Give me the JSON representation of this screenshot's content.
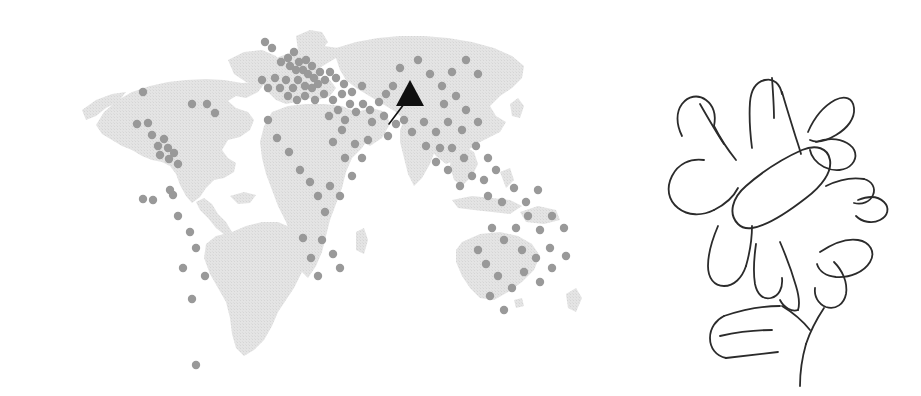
{
  "figure": {
    "kind": "world-map-with-handwritten-annotation",
    "background_color": "#ffffff"
  },
  "map": {
    "name": "world-dot-distribution-map",
    "projection": "equirectangular",
    "land_color": "#e3e3e3",
    "land_texture": "stippled",
    "point_color": "#999999",
    "point_radius_px": 4.2,
    "highlight_marker": {
      "name": "arrow-pointer-marker",
      "shape": "solid-triangle-with-tail",
      "color": "#111111",
      "triangle_apex": [
        410,
        80
      ],
      "triangle_left": [
        396,
        106
      ],
      "triangle_right": [
        424,
        106
      ],
      "tail_start": [
        404,
        104
      ],
      "tail_end": [
        389,
        124
      ],
      "target_label": "South Asia"
    },
    "points": [
      [
        148,
        123
      ],
      [
        152,
        135
      ],
      [
        164,
        139
      ],
      [
        158,
        146
      ],
      [
        168,
        148
      ],
      [
        174,
        153
      ],
      [
        169,
        159
      ],
      [
        178,
        164
      ],
      [
        160,
        155
      ],
      [
        143,
        92
      ],
      [
        137,
        124
      ],
      [
        192,
        104
      ],
      [
        207,
        104
      ],
      [
        215,
        113
      ],
      [
        153,
        200
      ],
      [
        170,
        190
      ],
      [
        178,
        216
      ],
      [
        190,
        232
      ],
      [
        196,
        248
      ],
      [
        183,
        268
      ],
      [
        205,
        276
      ],
      [
        192,
        299
      ],
      [
        173,
        195
      ],
      [
        196,
        365
      ],
      [
        143,
        199
      ],
      [
        265,
        42
      ],
      [
        272,
        48
      ],
      [
        281,
        62
      ],
      [
        288,
        58
      ],
      [
        294,
        52
      ],
      [
        299,
        62
      ],
      [
        303,
        70
      ],
      [
        296,
        70
      ],
      [
        290,
        66
      ],
      [
        306,
        60
      ],
      [
        312,
        66
      ],
      [
        308,
        74
      ],
      [
        314,
        78
      ],
      [
        320,
        72
      ],
      [
        318,
        84
      ],
      [
        325,
        80
      ],
      [
        330,
        72
      ],
      [
        336,
        78
      ],
      [
        312,
        88
      ],
      [
        305,
        86
      ],
      [
        298,
        80
      ],
      [
        293,
        88
      ],
      [
        286,
        80
      ],
      [
        280,
        88
      ],
      [
        275,
        78
      ],
      [
        268,
        88
      ],
      [
        262,
        80
      ],
      [
        288,
        96
      ],
      [
        297,
        100
      ],
      [
        305,
        96
      ],
      [
        315,
        100
      ],
      [
        324,
        94
      ],
      [
        333,
        100
      ],
      [
        342,
        94
      ],
      [
        350,
        104
      ],
      [
        338,
        110
      ],
      [
        329,
        116
      ],
      [
        345,
        120
      ],
      [
        356,
        112
      ],
      [
        363,
        104
      ],
      [
        370,
        110
      ],
      [
        379,
        102
      ],
      [
        386,
        94
      ],
      [
        393,
        86
      ],
      [
        268,
        120
      ],
      [
        277,
        138
      ],
      [
        289,
        152
      ],
      [
        300,
        170
      ],
      [
        310,
        182
      ],
      [
        318,
        196
      ],
      [
        325,
        212
      ],
      [
        322,
        240
      ],
      [
        333,
        254
      ],
      [
        340,
        268
      ],
      [
        318,
        276
      ],
      [
        311,
        258
      ],
      [
        303,
        238
      ],
      [
        330,
        186
      ],
      [
        340,
        196
      ],
      [
        352,
        176
      ],
      [
        345,
        158
      ],
      [
        355,
        144
      ],
      [
        362,
        158
      ],
      [
        368,
        140
      ],
      [
        342,
        130
      ],
      [
        333,
        142
      ],
      [
        400,
        68
      ],
      [
        418,
        60
      ],
      [
        430,
        74
      ],
      [
        442,
        86
      ],
      [
        452,
        72
      ],
      [
        466,
        60
      ],
      [
        478,
        74
      ],
      [
        456,
        96
      ],
      [
        444,
        104
      ],
      [
        466,
        110
      ],
      [
        478,
        122
      ],
      [
        462,
        130
      ],
      [
        448,
        122
      ],
      [
        436,
        132
      ],
      [
        424,
        122
      ],
      [
        412,
        132
      ],
      [
        404,
        120
      ],
      [
        426,
        146
      ],
      [
        440,
        148
      ],
      [
        452,
        148
      ],
      [
        464,
        158
      ],
      [
        476,
        146
      ],
      [
        488,
        158
      ],
      [
        496,
        170
      ],
      [
        484,
        180
      ],
      [
        472,
        176
      ],
      [
        460,
        186
      ],
      [
        448,
        170
      ],
      [
        436,
        162
      ],
      [
        488,
        196
      ],
      [
        502,
        202
      ],
      [
        514,
        188
      ],
      [
        526,
        202
      ],
      [
        538,
        190
      ],
      [
        528,
        216
      ],
      [
        516,
        228
      ],
      [
        504,
        240
      ],
      [
        492,
        228
      ],
      [
        540,
        230
      ],
      [
        552,
        216
      ],
      [
        564,
        228
      ],
      [
        550,
        248
      ],
      [
        536,
        258
      ],
      [
        522,
        250
      ],
      [
        486,
        264
      ],
      [
        498,
        276
      ],
      [
        512,
        288
      ],
      [
        524,
        272
      ],
      [
        540,
        282
      ],
      [
        552,
        268
      ],
      [
        566,
        256
      ],
      [
        478,
        250
      ],
      [
        490,
        296
      ],
      [
        504,
        310
      ],
      [
        372,
        122
      ],
      [
        384,
        116
      ],
      [
        396,
        124
      ],
      [
        388,
        136
      ],
      [
        352,
        92
      ],
      [
        362,
        86
      ],
      [
        344,
        84
      ]
    ]
  },
  "annotation": {
    "name": "handwritten-radial-letters",
    "stroke_color": "#2b2b2b",
    "stroke_width_px": 1.8,
    "layout": "radial-sunburst",
    "center": [
      155,
      205
    ],
    "center_glyph": {
      "name": "center-capsule-glyph",
      "shape": "elongated-oval",
      "rotation_deg": -35
    },
    "glyphs": [
      {
        "letter": "M",
        "position": "top",
        "angle_deg": 0
      },
      {
        "letter": "B",
        "position": "upper-right",
        "angle_deg": 45
      },
      {
        "letter": "m",
        "position": "right",
        "angle_deg": 75
      },
      {
        "letter": "B",
        "position": "lower-right",
        "angle_deg": 130
      },
      {
        "letter": "N",
        "position": "bottom",
        "angle_deg": 180
      },
      {
        "letter": "E",
        "position": "bottom-left-1",
        "angle_deg": 215
      },
      {
        "letter": "Y",
        "position": "bottom-left-2",
        "angle_deg": 225
      },
      {
        "letter": "U",
        "position": "lower-left",
        "angle_deg": 250
      },
      {
        "letter": "C",
        "position": "left",
        "angle_deg": 285
      },
      {
        "letter": "N",
        "position": "upper-left",
        "angle_deg": 320
      }
    ]
  }
}
